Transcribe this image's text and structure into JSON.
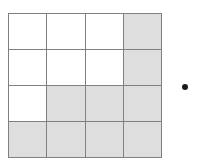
{
  "figure": {
    "kind": "shaded-grid-diagram",
    "grid": {
      "rows": 4,
      "columns": 4,
      "total_cells": 16,
      "shaded_count": 10,
      "unshaded_count": 6,
      "line_color": "#808080",
      "shaded_color": "#dedede",
      "unshaded_color": "#ffffff",
      "cells": [
        [
          {
            "id": "r1c1",
            "shaded": false
          },
          {
            "id": "r1c2",
            "shaded": false
          },
          {
            "id": "r1c3",
            "shaded": false
          },
          {
            "id": "r1c4",
            "shaded": true
          }
        ],
        [
          {
            "id": "r2c1",
            "shaded": false
          },
          {
            "id": "r2c2",
            "shaded": false
          },
          {
            "id": "r2c3",
            "shaded": false
          },
          {
            "id": "r2c4",
            "shaded": true
          }
        ],
        [
          {
            "id": "r3c1",
            "shaded": false
          },
          {
            "id": "r3c2",
            "shaded": true
          },
          {
            "id": "r3c3",
            "shaded": true
          },
          {
            "id": "r3c4",
            "shaded": true
          }
        ],
        [
          {
            "id": "r4c1",
            "shaded": true
          },
          {
            "id": "r4c2",
            "shaded": true
          },
          {
            "id": "r4c3",
            "shaded": true
          },
          {
            "id": "r4c4",
            "shaded": true
          }
        ]
      ]
    },
    "dot": {
      "label": "dot-marker",
      "color": "#1a1a1a",
      "diameter_px": 6
    }
  }
}
